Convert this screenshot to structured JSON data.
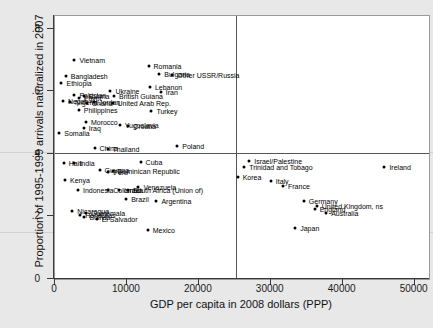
{
  "chart_data": {
    "type": "scatter",
    "title": "",
    "xlabel": "GDP per capita in 2008 dollars (PPP)",
    "ylabel": "Proportion of 1995-1999 arrivals naturalized in 2007",
    "xlim": [
      0,
      52000
    ],
    "ylim": [
      0,
      0.84
    ],
    "xticks": [
      "0",
      "10000",
      "20000",
      "30000",
      "40000",
      "50000"
    ],
    "xtickvals": [
      0,
      10000,
      20000,
      30000,
      40000,
      50000
    ],
    "yticks": [
      "0",
      ".2",
      ".4",
      ".6",
      ".8"
    ],
    "ytickvals": [
      0,
      0.2,
      0.4,
      0.6,
      0.8
    ],
    "grid": false,
    "legend": "none",
    "reference_lines": [
      {
        "axis": "vertical",
        "value": 25200
      },
      {
        "axis": "horizontal",
        "value": 0.403
      }
    ],
    "points": [
      {
        "label": "Vietnam",
        "x": 2700,
        "y": 0.7,
        "lx": 5
      },
      {
        "label": "Romania",
        "x": 13000,
        "y": 0.68,
        "lx": 5
      },
      {
        "label": "Bulgaria",
        "x": 14500,
        "y": 0.655,
        "lx": 5
      },
      {
        "label": "Other USSR/Russia",
        "x": 16300,
        "y": 0.65,
        "lx": 5
      },
      {
        "label": "Bangladesh",
        "x": 1500,
        "y": 0.648,
        "lx": 5
      },
      {
        "label": "Ethiopia",
        "x": 900,
        "y": 0.625,
        "lx": 5
      },
      {
        "label": "Lebanon",
        "x": 13200,
        "y": 0.613,
        "lx": 5
      },
      {
        "label": "Ukraine",
        "x": 7700,
        "y": 0.6,
        "lx": 5
      },
      {
        "label": "Iran",
        "x": 14700,
        "y": 0.597,
        "lx": 5
      },
      {
        "label": "Pakistan",
        "x": 2700,
        "y": 0.587,
        "lx": 5
      },
      {
        "label": "Burma",
        "x": 4000,
        "y": 0.585,
        "lx": 5
      },
      {
        "label": "British Guiana",
        "x": 8200,
        "y": 0.583,
        "lx": 5
      },
      {
        "label": "Egypt",
        "x": 3300,
        "y": 0.578,
        "lx": 5
      },
      {
        "label": "Nepal",
        "x": 1100,
        "y": 0.568,
        "lx": 5
      },
      {
        "label": "Nigeria",
        "x": 2100,
        "y": 0.566,
        "lx": 5
      },
      {
        "label": "Jordan",
        "x": 5400,
        "y": 0.566,
        "lx": 5
      },
      {
        "label": "Ghana",
        "x": 4400,
        "y": 0.563,
        "lx": 5
      },
      {
        "label": "United Arab Rep.",
        "x": 8000,
        "y": 0.562,
        "lx": 5
      },
      {
        "label": "Philippines",
        "x": 3300,
        "y": 0.54,
        "lx": 5
      },
      {
        "label": "Turkey",
        "x": 13400,
        "y": 0.538,
        "lx": 5
      },
      {
        "label": "Morocco",
        "x": 4300,
        "y": 0.5,
        "lx": 5
      },
      {
        "label": "Yugoslavia",
        "x": 9000,
        "y": 0.492,
        "lx": 5
      },
      {
        "label": "Croatia",
        "x": 10200,
        "y": 0.49,
        "lx": 5
      },
      {
        "label": "Iraq",
        "x": 4000,
        "y": 0.482,
        "lx": 5
      },
      {
        "label": "Somalia",
        "x": 600,
        "y": 0.465,
        "lx": 5
      },
      {
        "label": "China",
        "x": 5500,
        "y": 0.42,
        "lx": 5
      },
      {
        "label": "Thailand",
        "x": 7300,
        "y": 0.415,
        "lx": 5
      },
      {
        "label": "Poland",
        "x": 17000,
        "y": 0.425,
        "lx": 5
      },
      {
        "label": "Haiti",
        "x": 1200,
        "y": 0.372,
        "lx": 5
      },
      {
        "label": "India",
        "x": 2700,
        "y": 0.37,
        "lx": 5
      },
      {
        "label": "Cuba",
        "x": 11900,
        "y": 0.375,
        "lx": 5
      },
      {
        "label": "Israel/Palestine",
        "x": 27000,
        "y": 0.378,
        "lx": 5
      },
      {
        "label": "Trinidad and Tobago",
        "x": 26300,
        "y": 0.358,
        "lx": 5
      },
      {
        "label": "Ireland",
        "x": 45800,
        "y": 0.358,
        "lx": 5
      },
      {
        "label": "Guyana",
        "x": 6200,
        "y": 0.348,
        "lx": 5
      },
      {
        "label": "Peru",
        "x": 7400,
        "y": 0.342,
        "lx": 5
      },
      {
        "label": "Dominican Republic",
        "x": 8000,
        "y": 0.345,
        "lx": 5
      },
      {
        "label": "Kenya",
        "x": 1400,
        "y": 0.315,
        "lx": 5
      },
      {
        "label": "Korea",
        "x": 25400,
        "y": 0.325,
        "lx": 5
      },
      {
        "label": "Italy",
        "x": 30000,
        "y": 0.312,
        "lx": 5
      },
      {
        "label": "France",
        "x": 31700,
        "y": 0.298,
        "lx": 5
      },
      {
        "label": "Indonesia",
        "x": 3200,
        "y": 0.285,
        "lx": 5
      },
      {
        "label": "Colombia",
        "x": 7400,
        "y": 0.285,
        "lx": 5
      },
      {
        "label": "Israel",
        "x": 8900,
        "y": 0.283,
        "lx": 5
      },
      {
        "label": "Venezuela",
        "x": 11600,
        "y": 0.295,
        "lx": 5
      },
      {
        "label": "South Africa (Union of)",
        "x": 10100,
        "y": 0.283,
        "lx": 5
      },
      {
        "label": "Brazil",
        "x": 9900,
        "y": 0.255,
        "lx": 5
      },
      {
        "label": "Argentina",
        "x": 14100,
        "y": 0.248,
        "lx": 5
      },
      {
        "label": "Germany",
        "x": 34600,
        "y": 0.248,
        "lx": 5
      },
      {
        "label": "United Kingdom, ns",
        "x": 36400,
        "y": 0.232,
        "lx": 5
      },
      {
        "label": "England",
        "x": 36100,
        "y": 0.222,
        "lx": 5
      },
      {
        "label": "Australia",
        "x": 37700,
        "y": 0.212,
        "lx": 5
      },
      {
        "label": "Nicaragua",
        "x": 2400,
        "y": 0.218,
        "lx": 5
      },
      {
        "label": "Guatemala",
        "x": 4300,
        "y": 0.212,
        "lx": 5
      },
      {
        "label": "Honduras",
        "x": 3500,
        "y": 0.205,
        "lx": 5
      },
      {
        "label": "Bolivia",
        "x": 4100,
        "y": 0.198,
        "lx": 5
      },
      {
        "label": "El Salvador",
        "x": 5800,
        "y": 0.192,
        "lx": 5
      },
      {
        "label": "Japan",
        "x": 33400,
        "y": 0.162,
        "lx": 5
      },
      {
        "label": "Mexico",
        "x": 12900,
        "y": 0.158,
        "lx": 5
      }
    ]
  }
}
